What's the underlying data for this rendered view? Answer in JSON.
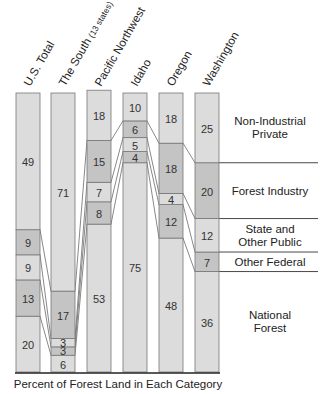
{
  "chart_data": {
    "type": "bar",
    "stacked": true,
    "normalized": true,
    "title": "",
    "xlabel": "Percent of Forest Land in Each Category",
    "ylabel": "",
    "ylim": [
      0,
      100
    ],
    "categories": [
      "U.S. Total",
      "The South",
      "Pacific Northwest",
      "Idaho",
      "Oregon",
      "Washington"
    ],
    "category_notes": {
      "The South": "(13 states)"
    },
    "series": [
      {
        "name": "National Forest",
        "label_lines": [
          "National",
          "Forest"
        ],
        "values": [
          20,
          6,
          53,
          75,
          48,
          36
        ],
        "color": "#dcdcdc"
      },
      {
        "name": "Other Federal",
        "label_lines": [
          "Other Federal"
        ],
        "values": [
          13,
          3,
          8,
          4,
          12,
          7
        ],
        "color": "#c4c4c4"
      },
      {
        "name": "State and Other Public",
        "label_lines": [
          "State and",
          "Other Public"
        ],
        "values": [
          9,
          3,
          7,
          5,
          4,
          12
        ],
        "color": "#dcdcdc"
      },
      {
        "name": "Forest Industry",
        "label_lines": [
          "Forest Industry"
        ],
        "values": [
          9,
          17,
          15,
          6,
          18,
          20
        ],
        "color": "#c4c4c4"
      },
      {
        "name": "Non-Industrial Private",
        "label_lines": [
          "Non-Industrial",
          "Private"
        ],
        "values": [
          49,
          71,
          18,
          10,
          18,
          25
        ],
        "color": "#dcdcdc"
      }
    ],
    "legend_position": "right",
    "grid": false
  },
  "labels": {
    "axis_title": "Percent of Forest Land in Each Category"
  }
}
